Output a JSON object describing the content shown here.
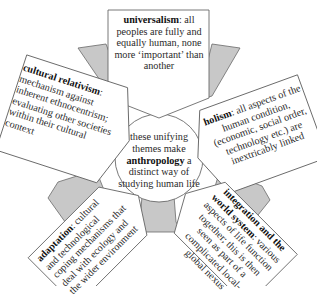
{
  "diagram": {
    "type": "radial-concept-diagram",
    "colors": {
      "wedge_fill": "#c8c8c8",
      "outline": "#6a6a6a",
      "box_fill": "#ffffff",
      "text": "#2a2a2a"
    },
    "center": {
      "pre": "these unifying themes make",
      "term": "anthropology",
      "post": "a distinct way of studying human life"
    },
    "themes": [
      {
        "id": "universalism",
        "term": "universalism",
        "separator": ":",
        "description": "all peoples are fully and equally human, none more ‘important’ than another"
      },
      {
        "id": "holism",
        "term": "holism",
        "separator": ":",
        "description": "all aspects of the human condition, (economic, social order, technology etc.) are inextricably linked"
      },
      {
        "id": "integration",
        "term": "integration and the world system",
        "separator": ":",
        "description": "various aspects of life function together; this is then seen as part of a complicated local-global nexus"
      },
      {
        "id": "adaptation",
        "term": "adaptation",
        "separator": ":",
        "description": "cultural and technological coping mechanisms that deal with ecology and the wider environment"
      },
      {
        "id": "cultural-relativism",
        "term": "cultural relativism",
        "separator": ":",
        "description": "mechanism against inherent ethnocentrism; evaluating other societies within their cultural context"
      }
    ]
  }
}
